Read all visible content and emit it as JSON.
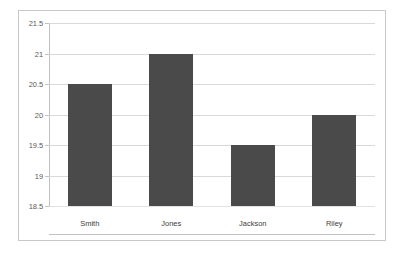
{
  "chart_data": {
    "type": "bar",
    "title": "",
    "subtitle": "",
    "xlabel": "",
    "ylabel": "",
    "categories": [
      "Smith",
      "Jones",
      "Jackson",
      "Riley"
    ],
    "values": [
      20.5,
      21.0,
      19.5,
      20.0
    ],
    "ylim": [
      18.5,
      21.5
    ],
    "ytick_values": [
      18.5,
      19,
      19.5,
      20,
      20.5,
      21,
      21.5
    ],
    "ytick_labels": [
      "18.5",
      "19",
      "19.5",
      "20",
      "20.5",
      "21",
      "21.5"
    ],
    "grid": true,
    "grid_axis": "y",
    "legend": false,
    "legend_position": "none",
    "bar_color": "#4a4a4a",
    "gridline_color": "#d9d9d9",
    "axis_color": "#c2c2c2",
    "plot_background": "#ffffff",
    "frame_border_color": "#c9c9c9",
    "tick_label_color": "#595959",
    "category_label_color": "#404040"
  }
}
